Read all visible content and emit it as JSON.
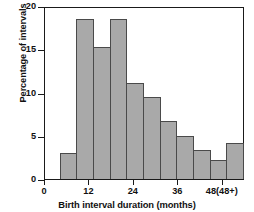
{
  "chart_data": {
    "type": "bar",
    "title": "",
    "xlabel": "Birth interval duration (months)",
    "ylabel": "Percentage of intervals",
    "ylim": [
      0,
      20
    ],
    "xlim": [
      0,
      54
    ],
    "grid": false,
    "legend": null,
    "bar_color": "#a9a9a9",
    "bar_edge_color": "#4a4a4a",
    "bin_width_months": 6,
    "categories": [
      "0-6",
      "6-12",
      "12-18",
      "18-24",
      "24-30",
      "30-36",
      "36-42",
      "42-48",
      "48-54",
      "54-60",
      "60+"
    ],
    "bin_starts": [
      0,
      6,
      12,
      18,
      24,
      30,
      36,
      42,
      48,
      54,
      60
    ],
    "values": [
      0,
      3.1,
      18.7,
      15.4,
      18.7,
      11.2,
      9.6,
      6.8,
      5.0,
      3.4,
      2.2
    ],
    "extra_bar_value": 4.2,
    "bars": [
      {
        "label": "0-6",
        "value": 0
      },
      {
        "label": "6-12",
        "value": 3.1
      },
      {
        "label": "12-18",
        "value": 18.7
      },
      {
        "label": "18-24",
        "value": 15.4
      },
      {
        "label": "24-30",
        "value": 18.7
      },
      {
        "label": "30-36",
        "value": 11.2
      },
      {
        "label": "36-42",
        "value": 9.6
      },
      {
        "label": "42-48",
        "value": 6.8
      },
      {
        "label": "48-54",
        "value": 5.0
      },
      {
        "label": "54-60",
        "value": 3.4
      },
      {
        "label": "60-66",
        "value": 2.2
      },
      {
        "label": "48+",
        "value": 4.2
      }
    ],
    "yticks": [
      {
        "value": 20,
        "label": "20"
      },
      {
        "value": 15,
        "label": "15"
      },
      {
        "value": 10,
        "label": "10"
      },
      {
        "value": 5,
        "label": "5"
      },
      {
        "value": 0,
        "label": "0"
      }
    ],
    "xticks": [
      {
        "value": 0,
        "label": "0"
      },
      {
        "value": 12,
        "label": "12"
      },
      {
        "value": 24,
        "label": "24"
      },
      {
        "value": 36,
        "label": "36"
      },
      {
        "value": 48,
        "label": "48(48+)"
      }
    ]
  }
}
